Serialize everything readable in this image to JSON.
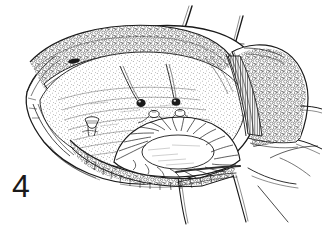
{
  "figure": {
    "label": "4",
    "caption": "",
    "type": "surgical line-art illustration",
    "style": "pen-and-ink cross-hatch engraving",
    "background_color": "#ffffff",
    "ink_color": "#1a1a1a",
    "width": 323,
    "height": 226
  },
  "regions": {
    "incision_name": "elliptical surgical incision",
    "skin_edge_name": "retracted skin flap",
    "fat_layer_name": "subcutaneous fat layer",
    "muscle_layer_name": "muscle fascia striations",
    "deep_field_name": "exposed deep surgical field",
    "dome_name": "radially striated dome structure",
    "right_flap_name": "right retracted tissue flap",
    "drape_name": "surgical drape edge"
  },
  "markers": {
    "suture_anchor_count": 2,
    "suture_knot_count": 2,
    "clamp_count": 1
  },
  "colors": {
    "ink": "#1a1a1a",
    "ink_light": "#4a4a4a",
    "ink_mid": "#2e2e2e",
    "paper": "#ffffff",
    "tone_light": "#e8e8e8",
    "tone_mid": "#c9c9c9"
  }
}
